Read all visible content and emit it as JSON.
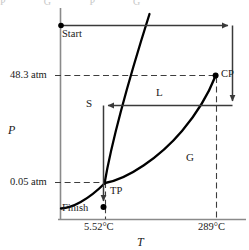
{
  "figure": {
    "type": "phase-diagram",
    "ghost_top_text": "P G P G"
  },
  "axes": {
    "x_label": "T",
    "y_label": "P",
    "x_ticks": [
      {
        "label": "5.52°C",
        "x": 105
      },
      {
        "label": "289°C",
        "x": 217
      }
    ],
    "y_ticks": [
      {
        "label": "48.3 atm",
        "y": 76
      },
      {
        "label": "0.05 atm",
        "y": 183
      }
    ]
  },
  "regions": [
    {
      "name": "S",
      "label": "S",
      "x": 86,
      "y": 104
    },
    {
      "name": "L",
      "label": "L",
      "x": 156,
      "y": 93
    },
    {
      "name": "G",
      "label": "G",
      "x": 186,
      "y": 158
    }
  ],
  "points": [
    {
      "name": "start",
      "label": "Start",
      "x": 62,
      "y": 32
    },
    {
      "name": "critical-point",
      "label": "CP",
      "x": 222,
      "y": 74
    },
    {
      "name": "triple-point",
      "label": "TP",
      "x": 111,
      "y": 192
    },
    {
      "name": "finish",
      "label": "Finish",
      "x": 62,
      "y": 210
    }
  ],
  "colors": {
    "curve": "#000000",
    "axis": "#808080",
    "path": "#3a3a3a",
    "dashed": "#4a4a4a",
    "text": "#1a1a1a"
  }
}
